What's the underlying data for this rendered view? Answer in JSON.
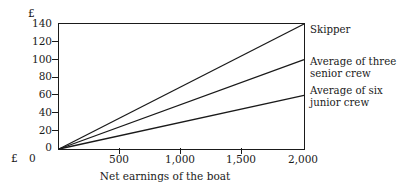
{
  "chart_data": {
    "type": "line",
    "title": "",
    "xlabel": "Net earnings of the boat",
    "ylabel": "£",
    "xlim": [
      0,
      2000
    ],
    "ylim": [
      0,
      140
    ],
    "grid": false,
    "legend_position": "right-inline",
    "x_ticks": [
      {
        "value": 0,
        "label": "0"
      },
      {
        "value": 500,
        "label": "500"
      },
      {
        "value": 1000,
        "label": "1,000"
      },
      {
        "value": 1500,
        "label": "1,500"
      },
      {
        "value": 2000,
        "label": "2,000"
      }
    ],
    "y_ticks": [
      {
        "value": 0,
        "label": "0"
      },
      {
        "value": 20,
        "label": "20"
      },
      {
        "value": 40,
        "label": "40"
      },
      {
        "value": 60,
        "label": "60"
      },
      {
        "value": 80,
        "label": "80"
      },
      {
        "value": 100,
        "label": "100"
      },
      {
        "value": 120,
        "label": "120"
      },
      {
        "value": 140,
        "label": "140"
      }
    ],
    "x": [
      0,
      2000
    ],
    "series": [
      {
        "name": "Skipper",
        "label": "Skipper",
        "values": [
          0,
          140
        ],
        "color": "#1a1a1a"
      },
      {
        "name": "Average of three senior crew",
        "label": "Average of three\nsenior crew",
        "values": [
          0,
          100
        ],
        "color": "#1a1a1a"
      },
      {
        "name": "Average of six junior crew",
        "label": "Average of six\njunior crew",
        "values": [
          0,
          60
        ],
        "color": "#1a1a1a"
      }
    ],
    "axis_currency_symbol_top": "£",
    "axis_currency_symbol_origin": "£",
    "origin_x_label": "0"
  }
}
